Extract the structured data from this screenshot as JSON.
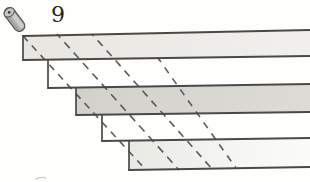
{
  "figure": {
    "label": "9"
  },
  "colors": {
    "paper": "#fefefc",
    "stroke": "#4a4946",
    "dashed_stroke": "#4c4b48",
    "band_light_start": "#e7e6e1",
    "band_light_end": "#f1f0ec",
    "band_dark_start": "#d2d1cc",
    "band_dark_end": "#dcdbd6",
    "band_faint_start": "#e9e9e4",
    "band_faint_mid": "#f5f5f2",
    "band_faint_end": "#fbfbf9",
    "cylinder_body": "#b2b1ac",
    "cylinder_highlight": "#d2d1cc",
    "cylinder_face": "#c8c7c2",
    "cylinder_outline": "#55534f",
    "cylinder_dot": "#46443f",
    "stray_mark": "#c3c2be",
    "label_color": "#232321"
  },
  "diagram": {
    "canvas": {
      "width": 310,
      "height": 182
    },
    "tread_lines": [
      {
        "x1": 23,
        "y1": 36,
        "x2": 310,
        "y2": 30,
        "width": 2.2
      },
      {
        "x1": 23,
        "y1": 60,
        "x2": 310,
        "y2": 56,
        "width": 1.8
      },
      {
        "x1": 48,
        "y1": 88,
        "x2": 310,
        "y2": 84,
        "width": 1.8
      },
      {
        "x1": 76,
        "y1": 115,
        "x2": 310,
        "y2": 112,
        "width": 1.8
      },
      {
        "x1": 102,
        "y1": 141,
        "x2": 310,
        "y2": 138,
        "width": 1.8
      },
      {
        "x1": 129,
        "y1": 170,
        "x2": 310,
        "y2": 167,
        "width": 1.9
      }
    ],
    "risers": [
      {
        "x": 23,
        "y1": 36,
        "y2": 60
      },
      {
        "x": 48,
        "y1": 60,
        "y2": 88
      },
      {
        "x": 76,
        "y1": 88,
        "y2": 115
      },
      {
        "x": 102,
        "y1": 115,
        "y2": 141
      },
      {
        "x": 129,
        "y1": 141,
        "y2": 170
      }
    ],
    "shaded_bands": [
      {
        "band_index": 0,
        "shade": "light"
      },
      {
        "band_index": 2,
        "shade": "dark"
      },
      {
        "band_index": 4,
        "shade": "faint"
      }
    ],
    "dashed_lines": [
      {
        "x1": 23,
        "y1": 36,
        "x2": 146,
        "y2": 170,
        "dash": "7 6",
        "offset": 0
      },
      {
        "x1": 57,
        "y1": 34,
        "x2": 179,
        "y2": 170,
        "dash": "8 6",
        "offset": 3
      },
      {
        "x1": 92,
        "y1": 34,
        "x2": 213,
        "y2": 170,
        "dash": "7.5 6",
        "offset": 5
      },
      {
        "x1": 158,
        "y1": 58,
        "x2": 236,
        "y2": 168,
        "dash": "7 6.5",
        "offset": 2
      }
    ],
    "cylinder": {
      "cx": 14.5,
      "cy": 19.5,
      "length": 27,
      "width": 11,
      "angle": 53,
      "face_cx": 9.2,
      "face_cy": 12.4,
      "face_rx": 5.6,
      "face_ry": 4.1
    },
    "stray_mark": {
      "d": "M36 179 q 5 -3 10 -1"
    }
  }
}
